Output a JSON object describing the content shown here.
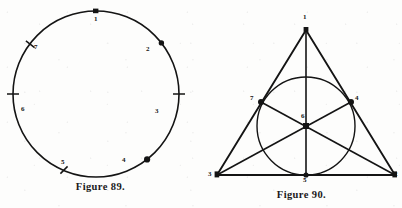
{
  "page": {
    "background_color": "#fdfdfc",
    "ink_color": "#141414"
  },
  "figures": [
    {
      "id": "figure-89",
      "caption": "Figure 89.",
      "shape": "circle",
      "description": "A plain circle divided by seven marked division points numbered 1 through 7.",
      "circle": {
        "cx": 96,
        "cy": 94,
        "r": 83
      },
      "points": [
        {
          "label": "1",
          "marker": "dot",
          "angle_deg": 90,
          "label_x": 94,
          "label_y": 16
        },
        {
          "label": "2",
          "marker": "dot",
          "angle_deg": 38,
          "label_x": 146,
          "label_y": 46
        },
        {
          "label": "3",
          "marker": "tick",
          "angle_deg": 0,
          "label_x": 155,
          "label_y": 108
        },
        {
          "label": "4",
          "marker": "dot",
          "angle_deg": -52,
          "label_x": 122,
          "label_y": 157
        },
        {
          "label": "5",
          "marker": "tick",
          "angle_deg": -110,
          "label_x": 61,
          "label_y": 159
        },
        {
          "label": "6",
          "marker": "tick",
          "angle_deg": 180,
          "label_x": 21,
          "label_y": 106
        },
        {
          "label": "7",
          "marker": "tick",
          "angle_deg": 142,
          "label_x": 34,
          "label_y": 44
        }
      ]
    },
    {
      "id": "figure-90",
      "caption": "Figure 90.",
      "shape": "triangle-with-incircle",
      "description": "An equilateral triangle with an inscribed circle; three cevians run from each vertex through the centre to the opposite side, meeting at the point labelled 6.",
      "triangle": {
        "vertex_top": {
          "label": "1",
          "x": 306,
          "y": 30,
          "label_x": 303,
          "label_y": 14
        },
        "vertex_bottom_left": {
          "label": "3",
          "x": 217,
          "y": 175,
          "label_x": 208,
          "label_y": 171
        },
        "vertex_bottom_right": {
          "label": "2",
          "x": 395,
          "y": 175,
          "label_x": 394,
          "label_y": 171
        }
      },
      "incircle": {
        "cx": 306,
        "cy": 126,
        "r": 49
      },
      "tangent_points": [
        {
          "label": "7",
          "x": 261,
          "y": 102,
          "label_x": 250,
          "label_y": 95
        },
        {
          "label": "4",
          "x": 351,
          "y": 102,
          "label_x": 355,
          "label_y": 95
        },
        {
          "label": "5",
          "x": 306,
          "y": 175,
          "label_x": 303,
          "label_y": 177
        }
      ],
      "center_point": {
        "label": "6",
        "x": 306,
        "y": 126,
        "label_x": 301,
        "label_y": 114
      }
    }
  ]
}
